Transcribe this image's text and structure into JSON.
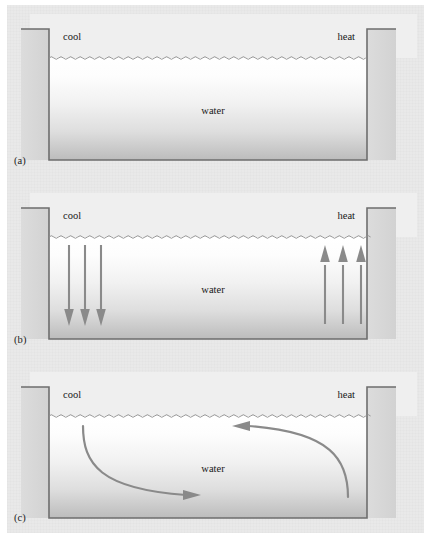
{
  "figure": {
    "background_color": "#e9e9e9",
    "panels": [
      {
        "id": "a",
        "label": "(a)",
        "label_x": 14,
        "label_y": 160,
        "top": 0,
        "air_label_left": "cool",
        "air_label_right": "heat",
        "water_label": "water",
        "arrows": "none",
        "description": "Still water in tank, no flow indicated"
      },
      {
        "id": "b",
        "label": "(b)",
        "label_x": 14,
        "label_y": 338,
        "top": 181,
        "air_label_left": "cool",
        "air_label_right": "heat",
        "water_label": "water",
        "arrows": "straight",
        "description": "Three straight downward arrows on the cool side, three straight upward arrows on the heat side",
        "down_arrow_count": 3,
        "up_arrow_count": 3
      },
      {
        "id": "c",
        "label": "(c)",
        "label_x": 14,
        "label_y": 518,
        "top": 360,
        "air_label_left": "cool",
        "air_label_right": "heat",
        "water_label": "water",
        "arrows": "curved",
        "description": "A curved arrow sweeping down then right along the cool side floor, and a curved arrow rising on the heat side then sweeping left near the surface",
        "curved_arrow_count": 2
      }
    ],
    "colors": {
      "arrow": "#8a8a8a",
      "tank_outline": "#6e6e6e",
      "wall_fill": "#d8d8d8",
      "air_fill": "#efefef",
      "water_top": "#ffffff",
      "water_bottom": "#b9b9b9",
      "text": "#171717",
      "page_background": "#e9e9e9"
    },
    "geometry": {
      "tank_left_x": 49,
      "tank_right_x": 367,
      "wall_top_y": 29,
      "water_surface_y": 58,
      "tank_floor_y": 160
    }
  }
}
